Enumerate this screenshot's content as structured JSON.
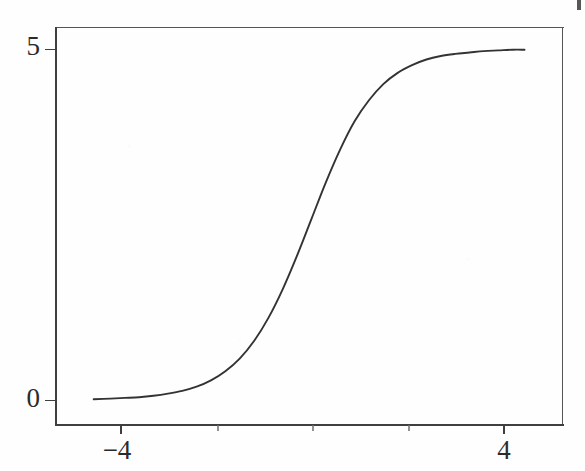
{
  "figure": {
    "background_color": "#fefefe",
    "line_color": "#333333",
    "axis_color": "#3f3f3f",
    "text_color": "#2b2b2b",
    "scan_artifact": {
      "name": "edge-scan-mark",
      "present": true
    }
  },
  "chart_data": {
    "type": "line",
    "title": "",
    "subtitle": "",
    "xlabel": "",
    "ylabel": "",
    "xlim": [
      -4.8,
      4.8
    ],
    "ylim": [
      -0.35,
      5.35
    ],
    "grid": false,
    "legend": null,
    "annotations": [],
    "axis": {
      "x_ticks": [
        -4,
        -2,
        0,
        2,
        4
      ],
      "x_tick_labels": [
        "−4",
        "",
        "",
        "",
        "4"
      ],
      "x_tick_labels_visible": [
        "−4",
        "4"
      ],
      "y_ticks": [
        0,
        5
      ],
      "y_tick_labels": [
        "0",
        "5"
      ]
    },
    "series": [
      {
        "name": "logistic",
        "description": "sigmoid curve rising from 0 to 5",
        "asymptote_low": 0,
        "asymptote_high": 5,
        "midpoint_x": -0.05,
        "steepness": 1.35,
        "x": [
          -4.55,
          -4.2,
          -3.9,
          -3.6,
          -3.3,
          -3.0,
          -2.7,
          -2.4,
          -2.1,
          -1.8,
          -1.5,
          -1.2,
          -0.9,
          -0.6,
          -0.3,
          0.0,
          0.3,
          0.6,
          0.9,
          1.2,
          1.5,
          1.8,
          2.1,
          2.4,
          2.7,
          3.0,
          3.3,
          3.6,
          3.9,
          4.2,
          4.45
        ],
        "values": [
          0.01,
          0.02,
          0.03,
          0.04,
          0.06,
          0.09,
          0.13,
          0.19,
          0.28,
          0.41,
          0.59,
          0.84,
          1.17,
          1.58,
          2.06,
          2.58,
          3.1,
          3.57,
          3.97,
          4.27,
          4.5,
          4.66,
          4.77,
          4.85,
          4.9,
          4.93,
          4.95,
          4.97,
          4.98,
          4.99,
          4.99
        ]
      }
    ]
  },
  "labels": {
    "y_top": "5",
    "y_bottom": "0",
    "x_left": "−4",
    "x_right": "4"
  }
}
